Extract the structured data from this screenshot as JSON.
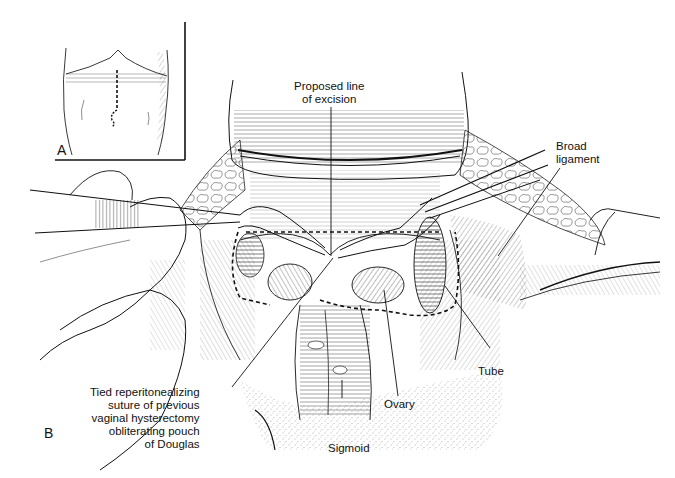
{
  "figure": {
    "panels": [
      {
        "id": "A",
        "letter": "A",
        "description": "Inset: abdomen with dashed midline incision line"
      },
      {
        "id": "B",
        "letter": "B",
        "description": "Operative field with retracted structures"
      }
    ],
    "labels": {
      "proposed_line": "Proposed line\nof excision",
      "broad_ligament": "Broad\nligament",
      "tied_suture": "Tied reperitonealizing\nsuture of previous\nvaginal hysterectomy\nobliterating pouch\nof Douglas",
      "tube": "Tube",
      "ovary": "Ovary",
      "sigmoid": "Sigmoid"
    },
    "colors": {
      "ink": "#111111",
      "paper": "#ffffff"
    }
  }
}
